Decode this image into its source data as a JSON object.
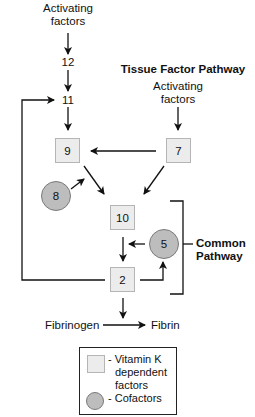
{
  "diagram": {
    "intrinsic": {
      "activating_label_line1": "Activating",
      "activating_label_line2": "factors",
      "factor12": "12",
      "factor11": "11"
    },
    "tissue_factor": {
      "title": "Tissue Factor Pathway",
      "activating_label_line1": "Activating",
      "activating_label_line2": "factors"
    },
    "factors": {
      "f9": "9",
      "f7": "7",
      "f8": "8",
      "f10": "10",
      "f5": "5",
      "f2": "2"
    },
    "common_pathway": {
      "line1": "Common",
      "line2": "Pathway"
    },
    "conversion": {
      "from": "Fibrinogen",
      "to": "Fibrin"
    },
    "legend": {
      "vitk_line1": "- Vitamin K",
      "vitk_line2": "dependent",
      "vitk_line3": "factors",
      "cofactors": "- Cofactors"
    },
    "colors": {
      "box_fill": "#ececec",
      "circle_fill": "#bdbdbd",
      "line": "#111111"
    }
  }
}
